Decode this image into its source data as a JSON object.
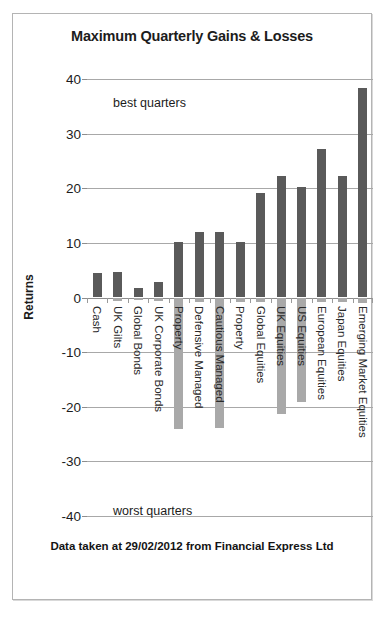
{
  "chart_data": {
    "type": "bar",
    "title": "Maximum Quarterly Gains & Losses",
    "xlabel": "",
    "ylabel": "Returns",
    "ylim": [
      -40,
      40
    ],
    "ytick_step": 10,
    "yticks": [
      40,
      30,
      20,
      10,
      0,
      -10,
      -20,
      -30,
      -40
    ],
    "grid": true,
    "legend_position": "none",
    "categories": [
      "Cash",
      "UK Gilts",
      "Global Bonds",
      "UK Corporate Bonds",
      "Property",
      "Defensive Managed",
      "Cautious Managed",
      "Property",
      "Global Equities",
      "UK Equities",
      "US Equities",
      "European Equities",
      "Japan Equities",
      "Emerging Market Equities"
    ],
    "series": [
      {
        "name": "best quarters",
        "color": "#5a5a5a",
        "values": [
          4.4,
          4.7,
          1.7,
          2.9,
          10.2,
          12.0,
          11.9,
          10.2,
          19.1,
          22.3,
          20.2,
          27.2,
          22.3,
          38.3
        ]
      },
      {
        "name": "worst quarters",
        "color": "#a9a9a9",
        "values": [
          0.0,
          -0.6,
          -0.5,
          -0.6,
          -24.0,
          -0.8,
          -23.9,
          -0.8,
          -0.9,
          -21.4,
          -19.2,
          -0.9,
          -0.9,
          -1.0
        ]
      }
    ],
    "annotations": [
      {
        "text": "best quarters",
        "position": "upper-left"
      },
      {
        "text": "worst quarters",
        "position": "lower-left"
      }
    ],
    "caption": "Data taken at 29/02/2012 from Financial Express Ltd"
  },
  "chart": {
    "title": "Maximum Quarterly Gains & Losses",
    "y_axis_title": "Returns",
    "annotation_best": "best quarters",
    "annotation_worst": "worst quarters",
    "caption": "Data taken at 29/02/2012 from Financial Express Ltd"
  }
}
